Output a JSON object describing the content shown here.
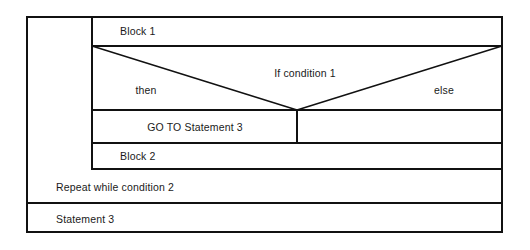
{
  "diagram": {
    "type": "nassi-shneiderman-structogram",
    "stroke_color": "#111111",
    "background_color": "#ffffff",
    "text_color": "#1a1a1a",
    "outer_border_width": 2,
    "inner_line_width": 1.2,
    "bounds": {
      "x1": 26,
      "y1": 16,
      "x2": 503,
      "y2": 233
    },
    "blocks": {
      "block1": {
        "label": "Block 1",
        "rect": {
          "x1": 92,
          "y1": 16,
          "x2": 503,
          "y2": 46
        },
        "text_x": 120,
        "text_y": 25
      },
      "condition": {
        "label": "If condition 1",
        "then_label": "then",
        "else_label": "else",
        "rect": {
          "x1": 92,
          "y1": 46,
          "x2": 503,
          "y2": 110
        },
        "vertex_x": 297,
        "vertex_y": 110,
        "condition_text_x": 305,
        "condition_text_y": 67,
        "then_text_x": 146,
        "then_text_y": 84,
        "else_text_x": 444,
        "else_text_y": 84
      },
      "goto": {
        "label": "GO TO Statement 3",
        "rect": {
          "x1": 92,
          "y1": 110,
          "x2": 297,
          "y2": 143
        },
        "text_x": 195,
        "text_y": 121
      },
      "else_empty": {
        "label": "",
        "rect": {
          "x1": 297,
          "y1": 110,
          "x2": 503,
          "y2": 143
        }
      },
      "block2": {
        "label": "Block 2",
        "rect": {
          "x1": 92,
          "y1": 143,
          "x2": 503,
          "y2": 169
        },
        "text_x": 120,
        "text_y": 150
      },
      "repeat": {
        "label": "Repeat while condition 2",
        "rect": {
          "x1": 26,
          "y1": 169,
          "x2": 503,
          "y2": 203
        },
        "text_x": 56,
        "text_y": 181
      },
      "statement3": {
        "label": "Statement 3",
        "rect": {
          "x1": 26,
          "y1": 203,
          "x2": 503,
          "y2": 233
        },
        "text_x": 56,
        "text_y": 213
      },
      "loop_column": {
        "label": "",
        "rect": {
          "x1": 26,
          "y1": 16,
          "x2": 92,
          "y2": 169
        }
      }
    }
  }
}
